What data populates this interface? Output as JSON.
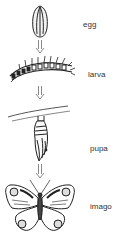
{
  "diagram": {
    "stages": [
      {
        "label": "egg"
      },
      {
        "label": "larva"
      },
      {
        "label": "pupa"
      },
      {
        "label": "imago"
      }
    ],
    "colors": {
      "line": "#222222",
      "arrow": "#888888",
      "text": "#333333"
    }
  }
}
